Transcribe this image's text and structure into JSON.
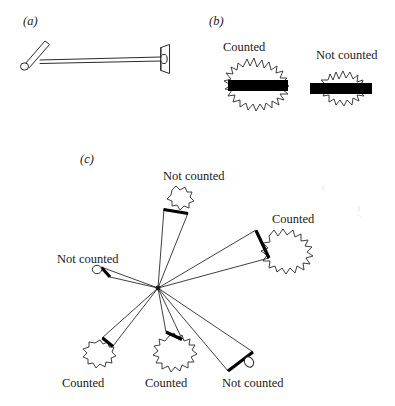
{
  "figure": {
    "background_color": "#ffffff",
    "ink_color": "#1a1a1a",
    "bar_color": "#000000"
  },
  "panels": [
    {
      "id": "a",
      "label": "(a)",
      "description": "probe-device"
    },
    {
      "id": "b",
      "label": "(b)",
      "items": [
        {
          "label": "Counted",
          "state": "counted"
        },
        {
          "label": "Not counted",
          "state": "not-counted"
        }
      ]
    },
    {
      "id": "c",
      "label": "(c)",
      "items": [
        {
          "label": "Not counted",
          "state": "not-counted",
          "position": "top"
        },
        {
          "label": "Counted",
          "state": "counted",
          "position": "right"
        },
        {
          "label": "Not counted",
          "state": "not-counted",
          "position": "left"
        },
        {
          "label": "Counted",
          "state": "counted",
          "position": "bottom-left"
        },
        {
          "label": "Counted",
          "state": "counted",
          "position": "bottom-center"
        },
        {
          "label": "Not counted",
          "state": "not-counted",
          "position": "bottom-right"
        }
      ]
    }
  ]
}
